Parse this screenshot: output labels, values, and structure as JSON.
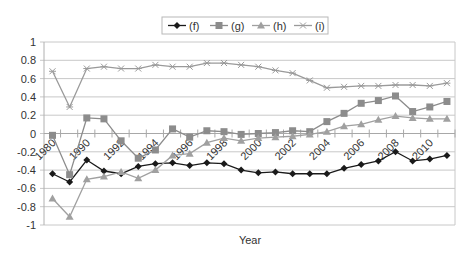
{
  "chart_data": {
    "type": "line",
    "title": "",
    "xlabel": "Year",
    "ylabel": "",
    "ylim": [
      -1,
      1
    ],
    "yticks": [
      1,
      0.8,
      0.6,
      0.4,
      0.2,
      0,
      -0.2,
      -0.4,
      -0.6,
      -0.8,
      -1
    ],
    "ytick_labels": [
      "1",
      "0.8",
      "0.6",
      "0.4",
      "0.2",
      "0",
      "-0.2",
      "-0.4",
      "-0.6",
      "-0.8",
      "-1"
    ],
    "grid": true,
    "legend_position": "top",
    "categories": [
      "1980",
      "1985",
      "1990",
      "1991",
      "1992",
      "1993",
      "1994",
      "1995",
      "1996",
      "1997",
      "1998",
      "1999",
      "2000",
      "2001",
      "2002",
      "2003",
      "2004",
      "2005",
      "2006",
      "2007",
      "2008",
      "2009",
      "2010",
      "2011"
    ],
    "xtick_labels_shown": [
      "1980",
      "1990",
      "1992",
      "1994",
      "1996",
      "1998",
      "2000",
      "2002",
      "2004",
      "2006",
      "2008",
      "2010"
    ],
    "series": [
      {
        "name": "(f)",
        "marker": "diamond",
        "color": "#1a1a1a",
        "values": [
          -0.44,
          -0.53,
          -0.29,
          -0.41,
          -0.44,
          -0.36,
          -0.33,
          -0.32,
          -0.35,
          -0.32,
          -0.33,
          -0.4,
          -0.43,
          -0.42,
          -0.44,
          -0.44,
          -0.44,
          -0.38,
          -0.34,
          -0.3,
          -0.2,
          -0.3,
          -0.28,
          -0.24
        ]
      },
      {
        "name": "(g)",
        "marker": "square",
        "color": "#8c8c8c",
        "values": [
          -0.02,
          -0.45,
          0.17,
          0.16,
          -0.08,
          -0.27,
          -0.18,
          0.05,
          -0.04,
          0.03,
          0.02,
          -0.01,
          0.0,
          0.01,
          0.03,
          0.02,
          0.13,
          0.22,
          0.33,
          0.36,
          0.41,
          0.24,
          0.29,
          0.35
        ]
      },
      {
        "name": "(h)",
        "marker": "triangle",
        "color": "#a0a0a0",
        "values": [
          -0.71,
          -0.91,
          -0.5,
          -0.47,
          -0.42,
          -0.49,
          -0.4,
          -0.24,
          -0.22,
          -0.1,
          -0.05,
          -0.08,
          -0.05,
          -0.04,
          -0.03,
          -0.01,
          0.02,
          0.08,
          0.1,
          0.15,
          0.19,
          0.17,
          0.16,
          0.16
        ]
      },
      {
        "name": "(i)",
        "marker": "x",
        "color": "#9a9a9a",
        "values": [
          0.68,
          0.29,
          0.71,
          0.73,
          0.71,
          0.71,
          0.75,
          0.73,
          0.73,
          0.77,
          0.77,
          0.75,
          0.73,
          0.69,
          0.66,
          0.58,
          0.5,
          0.51,
          0.52,
          0.52,
          0.53,
          0.53,
          0.52,
          0.55
        ]
      }
    ]
  },
  "legend": {
    "items": [
      "(f)",
      "(g)",
      "(h)",
      "(i)"
    ]
  },
  "axes": {
    "x_title": "Year"
  }
}
